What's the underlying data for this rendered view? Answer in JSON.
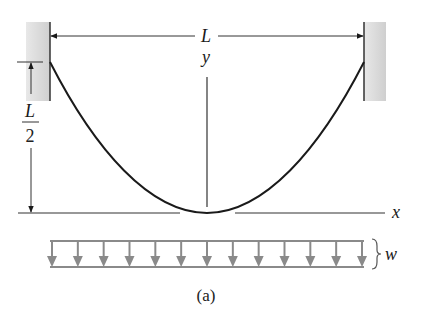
{
  "figure": {
    "caption": "(a)",
    "labels": {
      "span": "L",
      "y_axis": "y",
      "x_axis": "x",
      "sag_numerator": "L",
      "sag_denominator": "2",
      "load": "w"
    },
    "colors": {
      "line": "#1a1a1a",
      "wall_fill": "#d9d9d9",
      "load_gray": "#8a8a8a"
    },
    "load_arrow_count": 13
  }
}
